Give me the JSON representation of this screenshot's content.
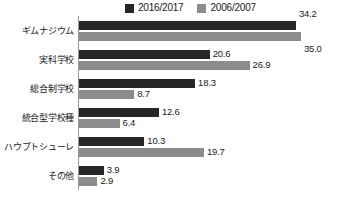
{
  "chart_data": {
    "type": "bar",
    "orientation": "horizontal",
    "title": "",
    "subtitle": "",
    "xlabel": "",
    "ylabel": "",
    "grid": false,
    "legend_position": "top",
    "xlim": [
      0,
      35.0
    ],
    "categories": [
      "ギムナジウム",
      "実科学校",
      "総合制学校",
      "統合型学校種",
      "ハウプトシューレ",
      "その他"
    ],
    "series": [
      {
        "name": "2016/2017",
        "color": "#262626",
        "values": [
          34.2,
          20.6,
          18.3,
          12.6,
          10.3,
          3.9
        ],
        "labels": [
          "34.2",
          "20.6",
          "18.3",
          "12.6",
          "10.3",
          "3.9"
        ]
      },
      {
        "name": "2006/2007",
        "color": "#8c8c8c",
        "values": [
          35.0,
          26.9,
          8.7,
          6.4,
          19.7,
          2.9
        ],
        "labels": [
          "35.0",
          "26.9",
          "8.7",
          "6.4",
          "19.7",
          "2.9"
        ]
      }
    ]
  },
  "legend": {
    "entries": [
      {
        "label": "2016/2017",
        "color": "#262626",
        "swatch": "legend-swatch-dark"
      },
      {
        "label": "2006/2007",
        "color": "#8c8c8c",
        "swatch": "legend-swatch-gray"
      }
    ]
  },
  "axis": {
    "line_color": "#9a9a9a"
  }
}
